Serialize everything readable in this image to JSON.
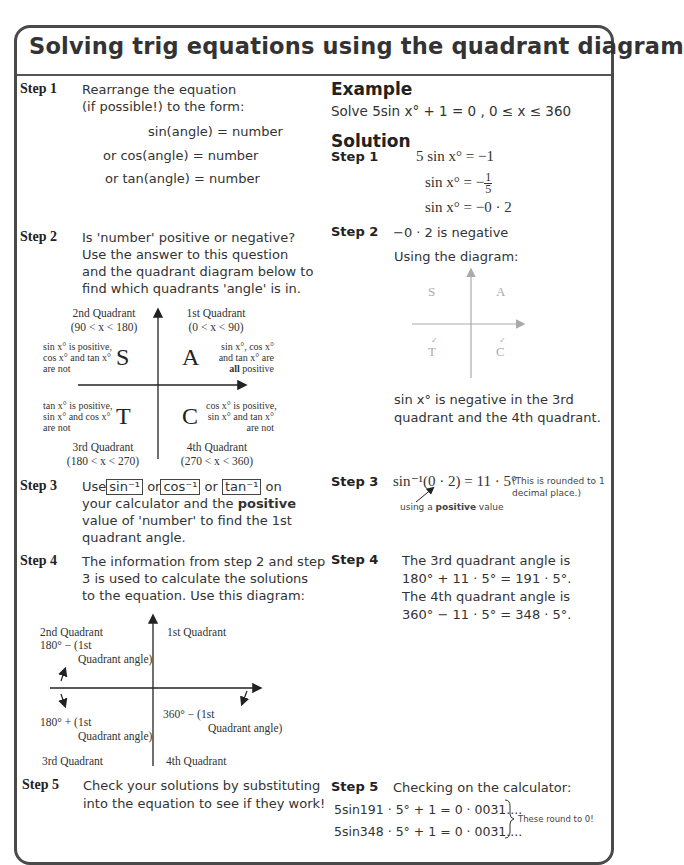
{
  "title": "Solving trig equations using the quadrant diagram",
  "left": {
    "step1": {
      "label": "Step 1",
      "line1": "Rearrange the equation",
      "line2": "(if possible!) to the form:",
      "forms": [
        "sin(angle) = number",
        "or cos(angle) = number",
        "or tan(angle) = number"
      ]
    },
    "step2": {
      "label": "Step 2",
      "lines": [
        "Is 'number' positive or negative?",
        "Use the answer to this question",
        "and the quadrant diagram below to",
        "find which quadrants 'angle' is in."
      ]
    },
    "cast_diagram": {
      "q2_title": "2nd Quadrant",
      "q2_range": "(90 < x < 180)",
      "q1_title": "1st Quadrant",
      "q1_range": "(0 < x < 90)",
      "q3_title": "3rd Quadrant",
      "q3_range": "(180 < x < 270)",
      "q4_title": "4th Quadrant",
      "q4_range": "(270 < x < 360)",
      "letter_s": "S",
      "letter_a": "A",
      "letter_t": "T",
      "letter_c": "C",
      "s_note": [
        "sin x° is positive,",
        "cos x° and tan x°",
        "are not"
      ],
      "a_note": [
        "sin x°, cos x°",
        "and tan x° are"
      ],
      "a_note_bold": "all",
      "a_note_end": " positive",
      "t_note": [
        "tan x° is positive,",
        "sin x° and cos x°",
        "are not"
      ],
      "c_note": [
        "cos x° is positive,",
        "sin x° and tan x°",
        "are not"
      ]
    },
    "step3": {
      "label": "Step 3",
      "use": "Use",
      "key_sin": "sin⁻¹",
      "or1": " or",
      "key_cos": "cos⁻¹",
      "or2": " or",
      "key_tan": "tan⁻¹",
      "on": " on",
      "line2_pre": "your calculator and the ",
      "line2_bold": "positive",
      "line3": "value of 'number' to find the 1st",
      "line4": "quadrant angle."
    },
    "step4": {
      "label": "Step 4",
      "lines": [
        "The information from step 2 and step",
        "3 is used to calculate the solutions",
        "to the equation. Use this diagram:"
      ]
    },
    "angle_diagram": {
      "q2_title": "2nd Quadrant",
      "q2_formula_1": "180° − (1st",
      "q2_formula_2": "Quadrant angle)",
      "q1_title": "1st Quadrant",
      "q3_formula_1": "180° + (1st",
      "q3_formula_2": "Quadrant angle)",
      "q3_title": "3rd Quadrant",
      "q4_formula_1": "360° − (1st",
      "q4_formula_2": "Quadrant angle)",
      "q4_title": "4th Quadrant"
    },
    "step5": {
      "label": "Step 5",
      "lines": [
        "Check your solutions by substituting",
        "into the equation to see if they work!"
      ]
    }
  },
  "right": {
    "example_heading": "Example",
    "example_text": "Solve  5sin x° + 1 = 0  ,  0 ≤ x ≤ 360",
    "solution_heading": "Solution",
    "step1": {
      "label": "Step 1",
      "eq1": "5 sin x° = −1",
      "eq2_left": "sin x° = −",
      "eq2_num": "1",
      "eq2_den": "5",
      "eq3": "sin x° = −0 · 2"
    },
    "step2": {
      "label": "Step 2",
      "text": "−0 · 2  is negative",
      "using": "Using the diagram:",
      "diagram": {
        "s": "S",
        "a": "A",
        "t": "T",
        "c": "C",
        "ticked": [
          "T",
          "C"
        ]
      },
      "result_1": "sin x° is negative in the 3rd",
      "result_2": "quadrant and the 4th quadrant."
    },
    "step3": {
      "label": "Step 3",
      "eq": "sin⁻¹(0 · 2) = 11 · 5°",
      "note_1": "(This is rounded to 1",
      "note_2": "decimal place.)",
      "annotation_pre": "using a ",
      "annotation_bold": "positive",
      "annotation_post": " value"
    },
    "step4": {
      "label": "Step 4",
      "lines": [
        "The 3rd quadrant angle is",
        "180° + 11 · 5° = 191 · 5°.",
        "The 4th quadrant angle is",
        "360° − 11 · 5° = 348 · 5°."
      ]
    },
    "step5": {
      "label": "Step 5",
      "text": "Checking on the calculator:",
      "check1": "5sin191 · 5° + 1 = 0 · 0031....",
      "check2": "5sin348 · 5° + 1 = 0 · 0031....",
      "note": "These round to 0!"
    }
  }
}
